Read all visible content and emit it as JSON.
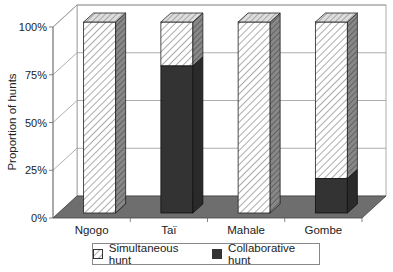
{
  "chart_data": {
    "type": "bar",
    "stacked": true,
    "percent": true,
    "three_d": true,
    "title": "",
    "xlabel": "",
    "ylabel": "Proportion of hunts",
    "categories": [
      "Ngogo",
      "Taï",
      "Mahale",
      "Gombe"
    ],
    "series": [
      {
        "name": "Collaborative hunt",
        "values": [
          0,
          77,
          0,
          18
        ],
        "color": "#333333",
        "pattern": "solid"
      },
      {
        "name": "Simultaneous hunt",
        "values": [
          100,
          23,
          100,
          82
        ],
        "color": "#ffffff",
        "pattern": "diagonal-hatch"
      }
    ],
    "yticks": [
      "0%",
      "25%",
      "50%",
      "75%",
      "100%"
    ],
    "ylim": [
      0,
      100
    ],
    "grid": true,
    "legend_position": "bottom"
  },
  "legend": {
    "items": [
      {
        "label": "Simultaneous hunt"
      },
      {
        "label": "Collaborative hunt"
      }
    ]
  }
}
